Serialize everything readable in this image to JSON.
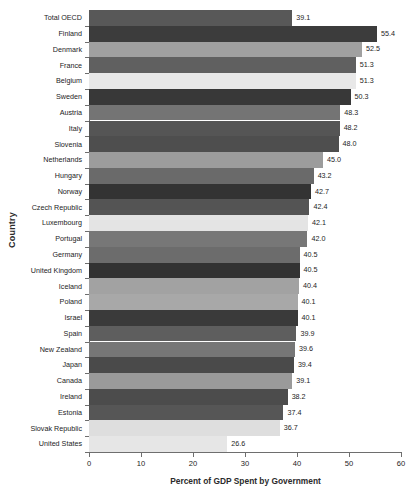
{
  "chart_data": {
    "type": "bar",
    "orientation": "horizontal",
    "title": "",
    "xlabel": "Percent of GDP Spent by Government",
    "ylabel": "Country",
    "xlim": [
      0,
      60
    ],
    "xticks": [
      0,
      10,
      20,
      30,
      40,
      50,
      60
    ],
    "grid": false,
    "legend": "none",
    "value_label_format": "one-decimal",
    "categories": [
      "Total OECD",
      "Finland",
      "Denmark",
      "France",
      "Belgium",
      "Sweden",
      "Austria",
      "Italy",
      "Slovenia",
      "Netherlands",
      "Hungary",
      "Norway",
      "Czech Republic",
      "Luxembourg",
      "Portugal",
      "Germany",
      "United Kingdom",
      "Iceland",
      "Poland",
      "Israel",
      "Spain",
      "New Zealand",
      "Japan",
      "Canada",
      "Ireland",
      "Estonia",
      "Slovak Republic",
      "United States"
    ],
    "values": [
      39.1,
      55.4,
      52.5,
      51.3,
      51.3,
      50.3,
      48.3,
      48.2,
      48.0,
      45.0,
      43.2,
      42.7,
      42.4,
      42.1,
      42.0,
      40.5,
      40.5,
      40.4,
      40.1,
      40.1,
      39.9,
      39.6,
      39.4,
      39.1,
      38.2,
      37.4,
      36.7,
      26.6
    ],
    "value_labels": [
      "39.1",
      "55.4",
      "52.5",
      "51.3",
      "51.3",
      "50.3",
      "48.3",
      "48.2",
      "48.0",
      "45.0",
      "43.2",
      "42.7",
      "42.4",
      "42.1",
      "42.0",
      "40.5",
      "40.5",
      "40.4",
      "40.1",
      "40.1",
      "39.9",
      "39.6",
      "39.4",
      "39.1",
      "38.2",
      "37.4",
      "36.7",
      "26.6"
    ],
    "bar_colors": [
      "#585858",
      "#3c3c3c",
      "#a0a0a0",
      "#606060",
      "#e8e8e8",
      "#383838",
      "#747474",
      "#555555",
      "#4e4e4e",
      "#9c9c9c",
      "#6a6a6a",
      "#333333",
      "#545454",
      "#e4e4e4",
      "#777777",
      "#6c6c6c",
      "#323232",
      "#a2a2a2",
      "#a8a8a8",
      "#3a3a3a",
      "#5e5e5e",
      "#767676",
      "#4a4a4a",
      "#9a9a9a",
      "#4c4c4c",
      "#565656",
      "#dedede",
      "#e6e6e6"
    ],
    "xtick_labels": [
      "0",
      "10",
      "20",
      "30",
      "40",
      "50",
      "60"
    ]
  },
  "axis": {
    "line_color": "#6e6e6e",
    "background": "#ffffff"
  }
}
